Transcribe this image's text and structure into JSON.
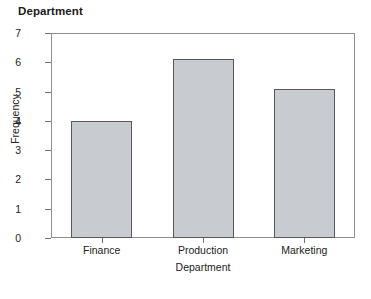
{
  "chart_data": {
    "type": "bar",
    "title": "Department",
    "xlabel": "Department",
    "ylabel": "Frequency",
    "categories": [
      "Finance",
      "Production",
      "Marketing"
    ],
    "values": [
      4.0,
      6.1,
      5.1
    ],
    "ylim": [
      0,
      7
    ],
    "yticks": [
      0,
      1,
      2,
      3,
      4,
      5,
      6,
      7
    ],
    "ytick_labels": [
      "0",
      "1",
      "2",
      "3",
      "4",
      "5",
      "6",
      "7"
    ],
    "grid": false,
    "legend": false,
    "bar_fill_color": "#c8cbd0",
    "bar_edge_color": "#59595c",
    "frame_color": "#8d8f92",
    "background_color": "#ffffff"
  }
}
